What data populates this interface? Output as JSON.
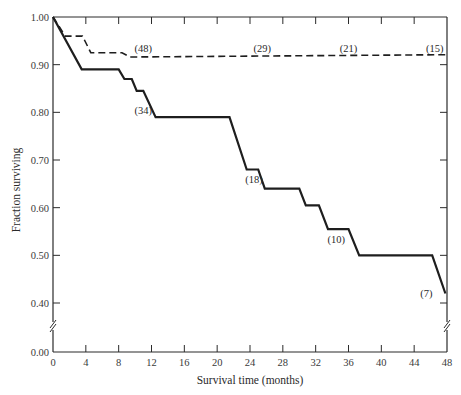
{
  "chart_data": {
    "type": "line",
    "title": "",
    "xlabel": "Survival time (months)",
    "ylabel": "Fraction surviving",
    "xlim": [
      0,
      48
    ],
    "ylim": [
      0.0,
      1.0
    ],
    "y_axis_break": [
      0.0,
      0.4
    ],
    "x_ticks": [
      0,
      4,
      8,
      12,
      16,
      20,
      24,
      28,
      32,
      36,
      40,
      44,
      48
    ],
    "y_ticks": [
      1.0,
      0.9,
      0.8,
      0.7,
      0.6,
      0.5,
      0.4,
      0.0
    ],
    "y_tick_labels": [
      "1.00",
      "0.90",
      "0.80",
      "0.70",
      "0.60",
      "0.50",
      "0.40",
      "0.00"
    ],
    "grid": false,
    "legend": null,
    "series": [
      {
        "name": "Group A (solid)",
        "style": "solid",
        "points": [
          [
            0,
            1.0
          ],
          [
            3.5,
            0.89
          ],
          [
            8,
            0.89
          ],
          [
            8.7,
            0.87
          ],
          [
            9.6,
            0.87
          ],
          [
            10.2,
            0.845
          ],
          [
            11,
            0.845
          ],
          [
            12.5,
            0.79
          ],
          [
            21.5,
            0.79
          ],
          [
            23.6,
            0.68
          ],
          [
            25,
            0.68
          ],
          [
            25.8,
            0.64
          ],
          [
            30,
            0.64
          ],
          [
            30.8,
            0.605
          ],
          [
            32.4,
            0.605
          ],
          [
            33.5,
            0.555
          ],
          [
            36,
            0.555
          ],
          [
            37.3,
            0.5
          ],
          [
            46.2,
            0.5
          ],
          [
            47.8,
            0.42
          ]
        ]
      },
      {
        "name": "Group B (dashed)",
        "style": "dashed",
        "points": [
          [
            0,
            1.0
          ],
          [
            1.5,
            0.96
          ],
          [
            3.6,
            0.96
          ],
          [
            4.6,
            0.925
          ],
          [
            8.4,
            0.925
          ],
          [
            9.4,
            0.916
          ],
          [
            48,
            0.921
          ]
        ]
      }
    ],
    "annotations": [
      {
        "text": "(48)",
        "x": 11,
        "y": 0.935
      },
      {
        "text": "(29)",
        "x": 25.5,
        "y": 0.935
      },
      {
        "text": "(21)",
        "x": 36,
        "y": 0.935
      },
      {
        "text": "(15)",
        "x": 46.5,
        "y": 0.935
      },
      {
        "text": "(34)",
        "x": 11,
        "y": 0.805
      },
      {
        "text": "(18)",
        "x": 24.5,
        "y": 0.66
      },
      {
        "text": "(10)",
        "x": 34.5,
        "y": 0.535
      },
      {
        "text": "(7)",
        "x": 45.5,
        "y": 0.42
      }
    ]
  }
}
